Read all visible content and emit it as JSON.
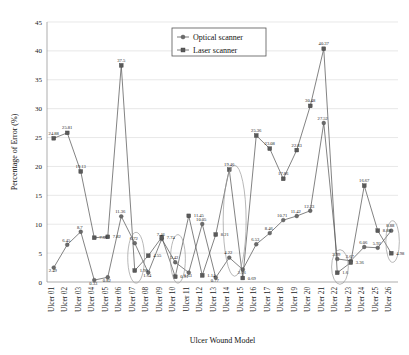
{
  "chart_data": {
    "type": "line",
    "title": "",
    "xlabel": "Ulcer Wound Model",
    "ylabel": "Percentage of Error (%)",
    "ylim": [
      0,
      45
    ],
    "yticks": [
      0,
      5,
      10,
      15,
      20,
      25,
      30,
      35,
      40,
      45
    ],
    "grid": true,
    "legend_position": "top-center",
    "categories": [
      "Ulcer 01",
      "Ulcer 02",
      "Ulcer 03",
      "Ulcer 04",
      "Ulcer 05",
      "Ulcer 06",
      "Ulcer 07",
      "Ulcer 08",
      "Ulcer 09",
      "Ulcer 10",
      "Ulcer 11",
      "Ulcer 12",
      "Ulcer 13",
      "Ulcer 14",
      "Ulcer 15",
      "Ulcer 16",
      "Ulcer 17",
      "Ulcer 18",
      "Ulcer 19",
      "Ulcer 20",
      "Ulcer 21",
      "Ulcer 22",
      "Ulcer 23",
      "Ulcer 24",
      "Ulcer 25",
      "Ulcer 26"
    ],
    "series": [
      {
        "name": "Optical scanner",
        "marker": "circle",
        "values": [
          2.49,
          6.45,
          8.7,
          0.33,
          0.82,
          11.36,
          6.72,
          1.64,
          7.46,
          3.42,
          1.63,
          10.05,
          0.77,
          4.22,
          2.16,
          6.53,
          8.46,
          10.71,
          11.42,
          12.33,
          27.52,
          3.99,
          3.67,
          6.06,
          5.92,
          8.88
        ]
      },
      {
        "name": "Laser scanner",
        "marker": "square",
        "values": [
          24.88,
          25.81,
          19.13,
          7.66,
          7.82,
          37.5,
          1.98,
          4.55,
          7.74,
          0.91,
          11.45,
          1.14,
          8.21,
          19.46,
          0.69,
          25.36,
          23.08,
          17.86,
          22.83,
          30.48,
          40.37,
          1.6,
          3.36,
          16.67,
          8.88,
          4.98
        ]
      }
    ],
    "annotations": [
      {
        "name": "highlight-ulcer-07",
        "center_index": 6.1,
        "center_value": 4.2,
        "rx_index": 0.62,
        "ry_value": 4.4
      },
      {
        "name": "highlight-ulcer-10",
        "center_index": 9.2,
        "center_value": 4.0,
        "rx_index": 0.55,
        "ry_value": 4.2
      },
      {
        "name": "highlight-ulcer-14",
        "center_index": 13.4,
        "center_value": 10.6,
        "rx_index": 0.85,
        "ry_value": 9.6
      },
      {
        "name": "highlight-ulcer-22",
        "center_index": 21.2,
        "center_value": 2.6,
        "rx_index": 0.62,
        "ry_value": 3.0
      },
      {
        "name": "highlight-ulcer-26",
        "center_index": 25.1,
        "center_value": 7.0,
        "rx_index": 0.5,
        "ry_value": 3.6
      }
    ]
  }
}
